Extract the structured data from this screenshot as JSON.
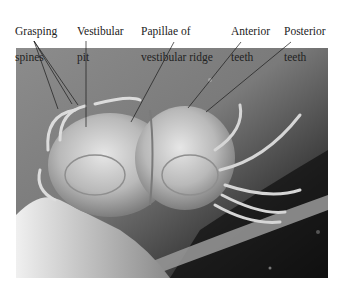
{
  "figure": {
    "labels": [
      {
        "id": "grasping-spines",
        "line1": "Grasping",
        "line2": "spines"
      },
      {
        "id": "vestibular-pit",
        "line1": "Vestibular",
        "line2": "pit"
      },
      {
        "id": "papillae",
        "line1": "Papillae of",
        "line2": "vestibular ridge"
      },
      {
        "id": "anterior-teeth",
        "line1": "Anterior",
        "line2": "teeth"
      },
      {
        "id": "posterior-teeth",
        "line1": "Posterior",
        "line2": "teeth"
      }
    ]
  }
}
